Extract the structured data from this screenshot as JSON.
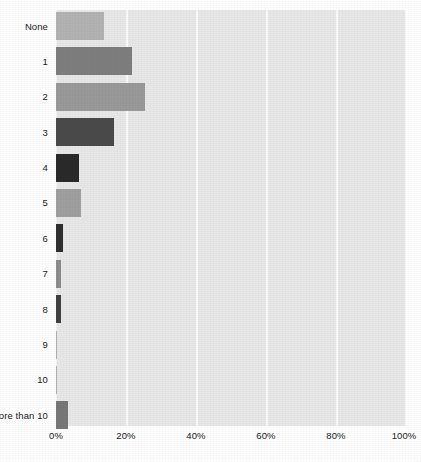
{
  "chart_data": {
    "type": "bar",
    "orientation": "horizontal",
    "title": "",
    "subtitle": "",
    "xlabel": "",
    "ylabel": "",
    "xlim": [
      0,
      100
    ],
    "grid": true,
    "legend": "none",
    "x_tick_labels": [
      "0%",
      "20%",
      "40%",
      "60%",
      "80%",
      "100%"
    ],
    "x_tick_values": [
      0,
      20,
      40,
      60,
      80,
      100
    ],
    "categories": [
      "None",
      "1",
      "2",
      "3",
      "4",
      "5",
      "6",
      "7",
      "8",
      "9",
      "10",
      "More than 10"
    ],
    "values": [
      13.8,
      21.7,
      25.4,
      16.6,
      6.6,
      7.1,
      2.0,
      1.3,
      1.5,
      0.3,
      0.3,
      3.4
    ],
    "bar_colors": [
      "#b3b3b3",
      "#7e7e7e",
      "#9a9a9a",
      "#4a4a4a",
      "#2a2a2a",
      "#a0a0a0",
      "#2f2f2f",
      "#8d8d8d",
      "#414141",
      "#b0b0b0",
      "#b0b0b0",
      "#787878"
    ],
    "plot_background": "#e8e8e8",
    "gridline_color": "#fbfbfb",
    "text_color": "#1a1a1a"
  }
}
